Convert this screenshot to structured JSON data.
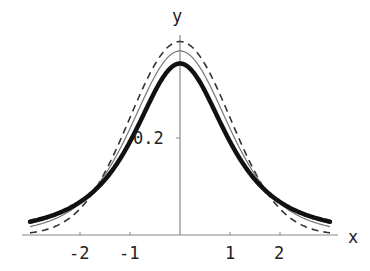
{
  "chart_data": {
    "type": "line",
    "title": "",
    "xlabel": "x",
    "ylabel": "y",
    "xlim": [
      -3,
      3
    ],
    "ylim": [
      0,
      0.42
    ],
    "x_ticks": [
      -2,
      -1,
      1,
      2
    ],
    "x_tick_labels": [
      "-2",
      "-1",
      "1",
      "2"
    ],
    "y_ticks": [
      0.2
    ],
    "y_tick_labels": [
      "0.2"
    ],
    "grid": false,
    "legend": null,
    "series": [
      {
        "name": "thick solid curve",
        "style": "solid-thick",
        "peak_at_x0": 0.354,
        "x": [
          -3,
          -2.5,
          -2,
          -1.5,
          -1,
          -0.5,
          0,
          0.5,
          1,
          1.5,
          2,
          2.5,
          3
        ],
        "values": [
          0.027,
          0.04,
          0.068,
          0.114,
          0.192,
          0.297,
          0.354,
          0.297,
          0.192,
          0.114,
          0.068,
          0.04,
          0.027
        ]
      },
      {
        "name": "thin solid curve",
        "style": "solid-thin",
        "peak_at_x0": 0.38,
        "x": [
          -3,
          -2.5,
          -2,
          -1.5,
          -1,
          -0.5,
          0,
          0.5,
          1,
          1.5,
          2,
          2.5,
          3
        ],
        "values": [
          0.017,
          0.03,
          0.065,
          0.124,
          0.22,
          0.333,
          0.38,
          0.333,
          0.22,
          0.124,
          0.065,
          0.03,
          0.017
        ]
      },
      {
        "name": "dashed curve",
        "style": "dashed",
        "peak_at_x0": 0.399,
        "x": [
          -3,
          -2.5,
          -2,
          -1.5,
          -1,
          -0.5,
          0,
          0.5,
          1,
          1.5,
          2,
          2.5,
          3
        ],
        "values": [
          0.004,
          0.018,
          0.054,
          0.13,
          0.242,
          0.352,
          0.399,
          0.352,
          0.242,
          0.13,
          0.054,
          0.018,
          0.004
        ]
      }
    ]
  },
  "axes": {
    "x_label": "x",
    "y_label": "y",
    "x_tick_labels": [
      "-2",
      "-1",
      "1",
      "2"
    ],
    "y_tick_label": "0.2"
  }
}
